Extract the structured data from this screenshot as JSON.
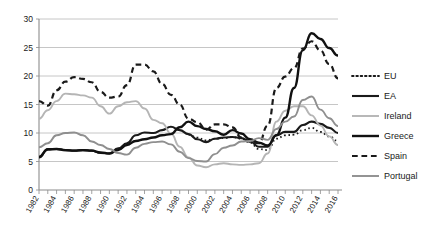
{
  "chart_data": {
    "type": "line",
    "title": "",
    "xlabel": "",
    "ylabel": "",
    "xlim": [
      1982,
      2016
    ],
    "ylim": [
      0,
      30
    ],
    "ytick_step": 5,
    "yticks": [
      "0",
      "5",
      "10",
      "15",
      "20",
      "25",
      "30"
    ],
    "xticks": [
      "1982",
      "1984",
      "1986",
      "1988",
      "1990",
      "1992",
      "1994",
      "1996",
      "1998",
      "2000",
      "2002",
      "2004",
      "2006",
      "2008",
      "2010",
      "2012",
      "2014",
      "2016"
    ],
    "x": [
      1982,
      1983,
      1984,
      1985,
      1986,
      1987,
      1988,
      1989,
      1990,
      1991,
      1992,
      1993,
      1994,
      1995,
      1996,
      1997,
      1998,
      1999,
      2000,
      2001,
      2002,
      2003,
      2004,
      2005,
      2006,
      2007,
      2008,
      2009,
      2010,
      2011,
      2012,
      2013,
      2014,
      2015,
      2016
    ],
    "grid": true,
    "legend_position": "right",
    "series": [
      {
        "name": "EU",
        "style": "dotted",
        "color": "#1a1a1a",
        "width": 1.8,
        "start_year": 1999,
        "values": [
          null,
          null,
          null,
          null,
          null,
          null,
          null,
          null,
          null,
          null,
          null,
          null,
          null,
          null,
          null,
          null,
          null,
          9.7,
          9.2,
          8.7,
          9.0,
          9.1,
          9.3,
          9.0,
          8.3,
          7.2,
          7.0,
          9.0,
          9.6,
          9.7,
          10.5,
          10.9,
          10.2,
          9.4,
          8.6
        ]
      },
      {
        "name": "EA",
        "style": "solid",
        "color": "#1a1a1a",
        "width": 2.1,
        "start_year": 1982,
        "values": [
          5.7,
          7.2,
          7.2,
          7.0,
          6.9,
          7.0,
          6.9,
          6.5,
          6.4,
          7.3,
          8.2,
          9.6,
          10.1,
          10.0,
          10.5,
          11.1,
          10.5,
          9.8,
          8.9,
          8.4,
          9.0,
          9.2,
          9.3,
          9.1,
          8.5,
          7.6,
          7.6,
          9.6,
          10.2,
          10.2,
          11.4,
          12.0,
          11.6,
          10.9,
          10.0
        ]
      },
      {
        "name": "Ireland",
        "style": "solid",
        "color": "#b5b5b5",
        "width": 1.9,
        "start_year": 1982,
        "values": [
          12.5,
          14.0,
          15.6,
          16.9,
          16.8,
          16.6,
          16.2,
          14.7,
          13.4,
          14.7,
          15.4,
          15.6,
          14.3,
          12.3,
          11.7,
          9.9,
          7.6,
          5.7,
          4.3,
          4.0,
          4.5,
          4.7,
          4.5,
          4.4,
          4.5,
          4.7,
          6.4,
          12.0,
          13.9,
          14.7,
          14.7,
          13.1,
          11.3,
          9.4,
          7.9
        ]
      },
      {
        "name": "Greece",
        "style": "solid",
        "color": "#111111",
        "width": 2.4,
        "start_year": 1982,
        "values": [
          5.8,
          7.1,
          7.2,
          7.0,
          6.9,
          7.0,
          6.9,
          6.6,
          6.4,
          7.0,
          7.9,
          8.6,
          8.9,
          9.2,
          9.6,
          9.8,
          11.0,
          12.0,
          11.2,
          10.7,
          10.3,
          9.7,
          10.5,
          9.9,
          8.9,
          8.3,
          7.8,
          9.6,
          12.7,
          17.9,
          24.5,
          27.5,
          26.5,
          24.9,
          23.6
        ]
      },
      {
        "name": "Spain",
        "style": "dashed",
        "color": "#1a1a1a",
        "width": 2.2,
        "start_year": 1982,
        "values": [
          15.6,
          14.8,
          17.5,
          19.0,
          19.8,
          19.5,
          18.9,
          17.2,
          16.2,
          16.4,
          18.4,
          22.0,
          22.0,
          20.8,
          18.6,
          16.7,
          15.0,
          12.5,
          11.9,
          10.6,
          11.5,
          11.5,
          11.0,
          9.2,
          8.5,
          8.2,
          11.3,
          17.9,
          19.9,
          21.4,
          24.8,
          26.1,
          24.5,
          22.1,
          19.6
        ]
      },
      {
        "name": "Portugal",
        "style": "solid",
        "color": "#8f8f8f",
        "width": 1.9,
        "start_year": 1982,
        "values": [
          7.5,
          8.2,
          9.6,
          10.0,
          10.1,
          9.6,
          8.5,
          7.9,
          7.2,
          6.5,
          6.2,
          7.4,
          8.1,
          8.4,
          8.5,
          8.0,
          6.7,
          5.6,
          5.1,
          5.0,
          6.3,
          7.4,
          7.8,
          8.5,
          8.6,
          9.1,
          8.8,
          10.7,
          12.0,
          12.9,
          15.8,
          16.4,
          14.1,
          12.6,
          11.2
        ]
      }
    ]
  },
  "legend": {
    "entries": [
      {
        "label": "EU"
      },
      {
        "label": "EA"
      },
      {
        "label": "Ireland"
      },
      {
        "label": "Greece"
      },
      {
        "label": "Spain"
      },
      {
        "label": "Portugal"
      }
    ]
  }
}
